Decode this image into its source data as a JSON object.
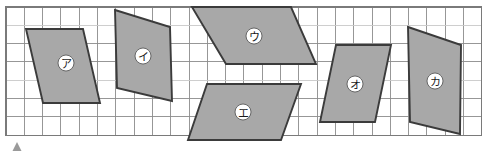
{
  "figure": {
    "background_color": "#ffffff",
    "grid": {
      "origin_x": 6,
      "origin_y": 7,
      "cell_size": 18.3,
      "cols": 26,
      "rows": 7,
      "line_color": "#8c8c8c",
      "border_color": "#7a7a7a"
    },
    "shape_fill_color": "#a8a8a8",
    "shape_stroke_color": "#3b3b3b",
    "marker": {
      "name": "up-triangle-marker",
      "x": 17,
      "y": 142,
      "size": 9,
      "color": "#9a9a9a"
    },
    "shapes": [
      {
        "label": "ア",
        "name": "parallelogram-a",
        "points": "26,29 83,29 100,103 43,103",
        "label_x": 66,
        "label_y": 63
      },
      {
        "label": "イ",
        "name": "quadrilateral-i",
        "points": "115,10 170,27 172,101 117,88",
        "label_x": 143,
        "label_y": 56
      },
      {
        "label": "ウ",
        "name": "parallelogram-u",
        "points": "192,7 291,7 316,64 226,64",
        "label_x": 254,
        "label_y": 36
      },
      {
        "label": "エ",
        "name": "parallelogram-e",
        "points": "207,84 301,84 281,140 188,140",
        "label_x": 243,
        "label_y": 112
      },
      {
        "label": "オ",
        "name": "parallelogram-o",
        "points": "336,45 391,45 375,122 320,122",
        "label_x": 355,
        "label_y": 84
      },
      {
        "label": "カ",
        "name": "quadrilateral-ka",
        "points": "408,27 461,45 460,134 410,122",
        "label_x": 435,
        "label_y": 81
      }
    ]
  }
}
